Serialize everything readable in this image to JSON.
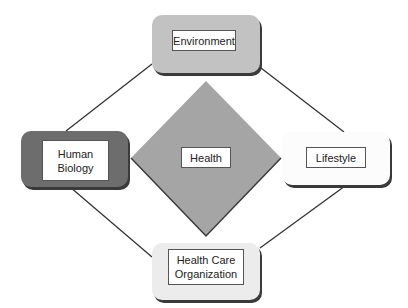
{
  "diagram": {
    "center": {
      "label": "Health",
      "shape": "diamond",
      "color": "#a5a5a5"
    },
    "nodes": [
      {
        "id": "env",
        "label": "Environment",
        "position": "top",
        "color": "#c2c2c2"
      },
      {
        "id": "hb",
        "label": "Human\nBiology",
        "position": "left",
        "color": "#6d6d6d"
      },
      {
        "id": "ls",
        "label": "Lifestyle",
        "position": "right",
        "color": "#fcfcfc"
      },
      {
        "id": "hco",
        "label": "Health Care\nOrganization",
        "position": "bottom",
        "color": "#ececec"
      }
    ],
    "edges": [
      [
        "Environment",
        "Human Biology"
      ],
      [
        "Environment",
        "Lifestyle"
      ],
      [
        "Human Biology",
        "Health Care Organization"
      ],
      [
        "Lifestyle",
        "Health Care Organization"
      ]
    ]
  }
}
